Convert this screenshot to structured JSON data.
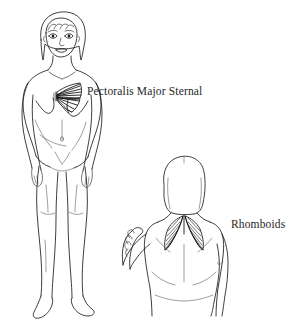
{
  "page": {
    "background_color": "#ffffff",
    "ink_color": "#1c1c1c",
    "muscle_color": "#0d0d0d",
    "width": 306,
    "height": 324
  },
  "illustration": {
    "title": "",
    "figures": [
      {
        "id": "anterior-female-figure",
        "view": "anterior",
        "description": "Front view line drawing of a standing female figure with shoulder-length hair",
        "highlighted_muscle": "Pectoralis Major Sternal"
      },
      {
        "id": "posterior-female-figure",
        "view": "posterior",
        "description": "Back view line drawing of a female figure from the hips up with the left arm raised and bent",
        "highlighted_muscle": "Rhomboids"
      }
    ]
  },
  "labels": {
    "pectoralis": "Pectoralis Major Sternal",
    "rhomboids": "Rhomboids"
  }
}
